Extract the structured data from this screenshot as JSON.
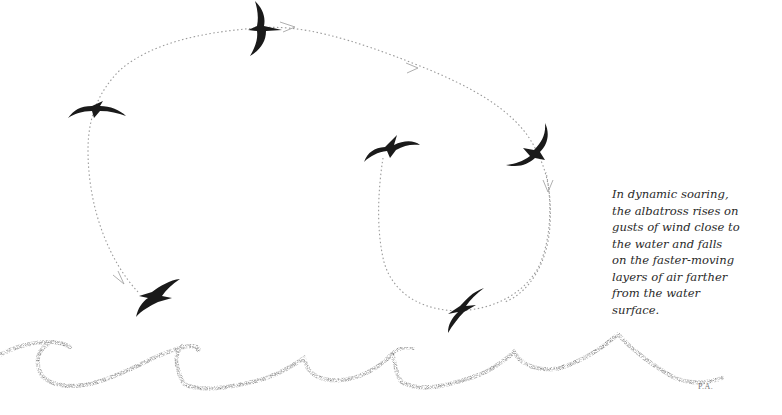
{
  "figure": {
    "caption_lines": [
      "In dynamic soaring,",
      "the albatross rises on",
      "gusts of wind close to",
      "the water and falls",
      "on the faster-moving",
      "layers of air farther",
      "from the water",
      "surface."
    ],
    "signature": "P.A.",
    "colors": {
      "background": "#ffffff",
      "bird": "#1a1a1a",
      "flight_path": "#9a9a9a",
      "waves": "#6e6e6e",
      "caption_text": "#2a2a2a"
    },
    "birds": [
      {
        "id": "top",
        "x": 258,
        "y": 28
      },
      {
        "id": "upper-left",
        "x": 96,
        "y": 111
      },
      {
        "id": "middle",
        "x": 392,
        "y": 148
      },
      {
        "id": "upper-right",
        "x": 530,
        "y": 146
      },
      {
        "id": "lower-left",
        "x": 158,
        "y": 294
      },
      {
        "id": "lower-right",
        "x": 463,
        "y": 308
      }
    ],
    "flight_paths": [
      "large-loop",
      "small-loop"
    ],
    "waves": "stippled ocean wave line"
  }
}
